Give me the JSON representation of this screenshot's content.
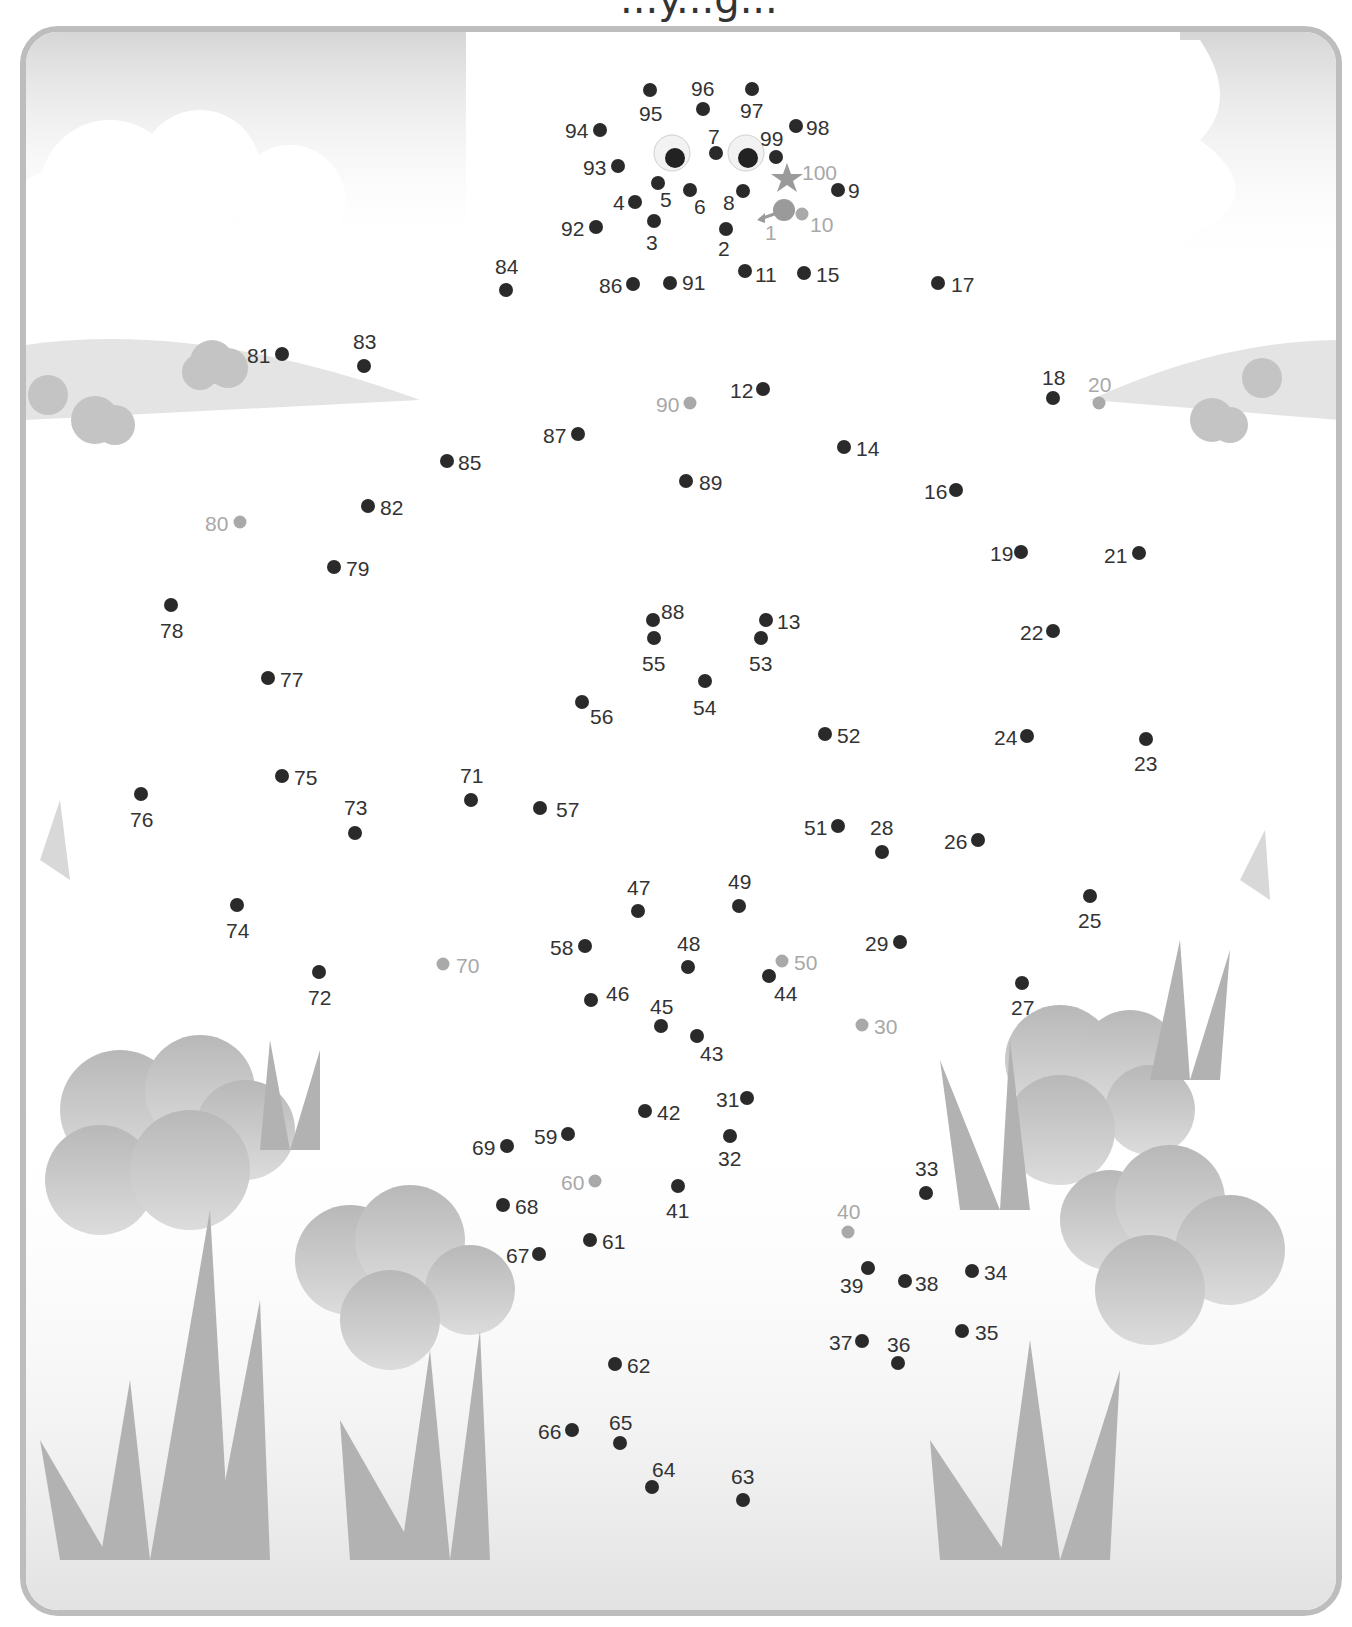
{
  "page": {
    "type": "dot-to-dot activity sheet",
    "title_fragment": "...y...g..."
  },
  "colors": {
    "dot_normal": "#2a2a2a",
    "dot_decade": "#a9a9a9",
    "frame": "#bdbdbd",
    "scenery": "#c8c8c8"
  },
  "start_marker": {
    "label": "1",
    "icon": "start-arrow-icon"
  },
  "end_marker": {
    "label": "100",
    "icon": "star-icon"
  },
  "decorations": [
    "googly-eye-left",
    "googly-eye-right",
    "cloud",
    "hills",
    "bushes",
    "grass-tufts"
  ],
  "dots": [
    {
      "n": "1",
      "x": 771,
      "y": 216,
      "lx": 765,
      "ly": 222,
      "grey": true,
      "start": true
    },
    {
      "n": "2",
      "x": 726,
      "y": 229,
      "lx": 718,
      "ly": 238,
      "grey": false
    },
    {
      "n": "3",
      "x": 654,
      "y": 221,
      "lx": 646,
      "ly": 232,
      "grey": false
    },
    {
      "n": "4",
      "x": 635,
      "y": 202,
      "lx": 613,
      "ly": 192,
      "grey": false
    },
    {
      "n": "5",
      "x": 658,
      "y": 183,
      "lx": 660,
      "ly": 189,
      "grey": false
    },
    {
      "n": "6",
      "x": 690,
      "y": 190,
      "lx": 694,
      "ly": 196,
      "grey": false
    },
    {
      "n": "7",
      "x": 716,
      "y": 153,
      "lx": 708,
      "ly": 126,
      "grey": false
    },
    {
      "n": "8",
      "x": 743,
      "y": 191,
      "lx": 723,
      "ly": 192,
      "grey": false
    },
    {
      "n": "9",
      "x": 838,
      "y": 190,
      "lx": 848,
      "ly": 180,
      "grey": false
    },
    {
      "n": "10",
      "x": 802,
      "y": 214,
      "lx": 810,
      "ly": 214,
      "grey": true
    },
    {
      "n": "11",
      "x": 745,
      "y": 271,
      "lx": 755,
      "ly": 264,
      "grey": false
    },
    {
      "n": "12",
      "x": 763,
      "y": 389,
      "lx": 730,
      "ly": 380,
      "grey": false
    },
    {
      "n": "13",
      "x": 766,
      "y": 620,
      "lx": 777,
      "ly": 611,
      "grey": false
    },
    {
      "n": "14",
      "x": 844,
      "y": 447,
      "lx": 856,
      "ly": 438,
      "grey": false
    },
    {
      "n": "15",
      "x": 804,
      "y": 273,
      "lx": 816,
      "ly": 264,
      "grey": false
    },
    {
      "n": "16",
      "x": 956,
      "y": 490,
      "lx": 924,
      "ly": 481,
      "grey": false
    },
    {
      "n": "17",
      "x": 938,
      "y": 283,
      "lx": 951,
      "ly": 274,
      "grey": false
    },
    {
      "n": "18",
      "x": 1053,
      "y": 398,
      "lx": 1042,
      "ly": 367,
      "grey": false
    },
    {
      "n": "19",
      "x": 1021,
      "y": 552,
      "lx": 990,
      "ly": 543,
      "grey": false
    },
    {
      "n": "20",
      "x": 1099,
      "y": 403,
      "lx": 1088,
      "ly": 374,
      "grey": true
    },
    {
      "n": "21",
      "x": 1139,
      "y": 553,
      "lx": 1104,
      "ly": 545,
      "grey": false
    },
    {
      "n": "22",
      "x": 1053,
      "y": 631,
      "lx": 1020,
      "ly": 622,
      "grey": false
    },
    {
      "n": "23",
      "x": 1146,
      "y": 739,
      "lx": 1134,
      "ly": 753,
      "grey": false
    },
    {
      "n": "24",
      "x": 1027,
      "y": 736,
      "lx": 994,
      "ly": 727,
      "grey": false
    },
    {
      "n": "25",
      "x": 1090,
      "y": 896,
      "lx": 1078,
      "ly": 910,
      "grey": false
    },
    {
      "n": "26",
      "x": 978,
      "y": 840,
      "lx": 944,
      "ly": 831,
      "grey": false
    },
    {
      "n": "27",
      "x": 1022,
      "y": 983,
      "lx": 1011,
      "ly": 997,
      "grey": false
    },
    {
      "n": "28",
      "x": 882,
      "y": 852,
      "lx": 870,
      "ly": 817,
      "grey": false
    },
    {
      "n": "29",
      "x": 900,
      "y": 942,
      "lx": 865,
      "ly": 933,
      "grey": false
    },
    {
      "n": "30",
      "x": 862,
      "y": 1025,
      "lx": 874,
      "ly": 1016,
      "grey": true
    },
    {
      "n": "31",
      "x": 747,
      "y": 1098,
      "lx": 716,
      "ly": 1089,
      "grey": false
    },
    {
      "n": "32",
      "x": 730,
      "y": 1136,
      "lx": 718,
      "ly": 1148,
      "grey": false
    },
    {
      "n": "33",
      "x": 926,
      "y": 1193,
      "lx": 915,
      "ly": 1158,
      "grey": false
    },
    {
      "n": "34",
      "x": 972,
      "y": 1271,
      "lx": 984,
      "ly": 1262,
      "grey": false
    },
    {
      "n": "35",
      "x": 962,
      "y": 1331,
      "lx": 975,
      "ly": 1322,
      "grey": false
    },
    {
      "n": "36",
      "x": 898,
      "y": 1363,
      "lx": 887,
      "ly": 1334,
      "grey": false
    },
    {
      "n": "37",
      "x": 862,
      "y": 1341,
      "lx": 829,
      "ly": 1332,
      "grey": false
    },
    {
      "n": "38",
      "x": 905,
      "y": 1281,
      "lx": 915,
      "ly": 1273,
      "grey": false
    },
    {
      "n": "39",
      "x": 868,
      "y": 1268,
      "lx": 840,
      "ly": 1275,
      "grey": false
    },
    {
      "n": "40",
      "x": 848,
      "y": 1232,
      "lx": 837,
      "ly": 1201,
      "grey": true
    },
    {
      "n": "41",
      "x": 678,
      "y": 1186,
      "lx": 666,
      "ly": 1200,
      "grey": false
    },
    {
      "n": "42",
      "x": 645,
      "y": 1111,
      "lx": 657,
      "ly": 1102,
      "grey": false
    },
    {
      "n": "43",
      "x": 697,
      "y": 1036,
      "lx": 700,
      "ly": 1043,
      "grey": false
    },
    {
      "n": "44",
      "x": 769,
      "y": 976,
      "lx": 774,
      "ly": 983,
      "grey": false
    },
    {
      "n": "45",
      "x": 661,
      "y": 1026,
      "lx": 650,
      "ly": 996,
      "grey": false
    },
    {
      "n": "46",
      "x": 591,
      "y": 1000,
      "lx": 606,
      "ly": 983,
      "grey": false
    },
    {
      "n": "47",
      "x": 638,
      "y": 911,
      "lx": 627,
      "ly": 877,
      "grey": false
    },
    {
      "n": "48",
      "x": 688,
      "y": 967,
      "lx": 677,
      "ly": 933,
      "grey": false
    },
    {
      "n": "49",
      "x": 739,
      "y": 906,
      "lx": 728,
      "ly": 871,
      "grey": false
    },
    {
      "n": "50",
      "x": 782,
      "y": 961,
      "lx": 794,
      "ly": 952,
      "grey": true
    },
    {
      "n": "51",
      "x": 838,
      "y": 826,
      "lx": 804,
      "ly": 817,
      "grey": false
    },
    {
      "n": "52",
      "x": 825,
      "y": 734,
      "lx": 837,
      "ly": 725,
      "grey": false
    },
    {
      "n": "53",
      "x": 761,
      "y": 638,
      "lx": 749,
      "ly": 653,
      "grey": false
    },
    {
      "n": "54",
      "x": 705,
      "y": 681,
      "lx": 693,
      "ly": 697,
      "grey": false
    },
    {
      "n": "55",
      "x": 654,
      "y": 638,
      "lx": 642,
      "ly": 653,
      "grey": false
    },
    {
      "n": "56",
      "x": 582,
      "y": 702,
      "lx": 590,
      "ly": 706,
      "grey": false
    },
    {
      "n": "57",
      "x": 540,
      "y": 808,
      "lx": 556,
      "ly": 799,
      "grey": false
    },
    {
      "n": "58",
      "x": 585,
      "y": 946,
      "lx": 550,
      "ly": 937,
      "grey": false
    },
    {
      "n": "59",
      "x": 568,
      "y": 1134,
      "lx": 534,
      "ly": 1126,
      "grey": false
    },
    {
      "n": "60",
      "x": 595,
      "y": 1181,
      "lx": 561,
      "ly": 1172,
      "grey": true
    },
    {
      "n": "61",
      "x": 590,
      "y": 1240,
      "lx": 602,
      "ly": 1231,
      "grey": false
    },
    {
      "n": "62",
      "x": 615,
      "y": 1364,
      "lx": 627,
      "ly": 1355,
      "grey": false
    },
    {
      "n": "63",
      "x": 743,
      "y": 1500,
      "lx": 731,
      "ly": 1466,
      "grey": false
    },
    {
      "n": "64",
      "x": 652,
      "y": 1487,
      "lx": 652,
      "ly": 1459,
      "grey": false
    },
    {
      "n": "65",
      "x": 620,
      "y": 1443,
      "lx": 609,
      "ly": 1412,
      "grey": false
    },
    {
      "n": "66",
      "x": 572,
      "y": 1430,
      "lx": 538,
      "ly": 1421,
      "grey": false
    },
    {
      "n": "67",
      "x": 539,
      "y": 1254,
      "lx": 506,
      "ly": 1245,
      "grey": false
    },
    {
      "n": "68",
      "x": 503,
      "y": 1205,
      "lx": 515,
      "ly": 1196,
      "grey": false
    },
    {
      "n": "69",
      "x": 507,
      "y": 1146,
      "lx": 472,
      "ly": 1137,
      "grey": false
    },
    {
      "n": "70",
      "x": 443,
      "y": 964,
      "lx": 456,
      "ly": 955,
      "grey": true
    },
    {
      "n": "71",
      "x": 471,
      "y": 800,
      "lx": 460,
      "ly": 765,
      "grey": false
    },
    {
      "n": "72",
      "x": 319,
      "y": 972,
      "lx": 308,
      "ly": 987,
      "grey": false
    },
    {
      "n": "73",
      "x": 355,
      "y": 833,
      "lx": 344,
      "ly": 797,
      "grey": false
    },
    {
      "n": "74",
      "x": 237,
      "y": 905,
      "lx": 226,
      "ly": 920,
      "grey": false
    },
    {
      "n": "75",
      "x": 282,
      "y": 776,
      "lx": 294,
      "ly": 767,
      "grey": false
    },
    {
      "n": "76",
      "x": 141,
      "y": 794,
      "lx": 130,
      "ly": 809,
      "grey": false
    },
    {
      "n": "77",
      "x": 268,
      "y": 678,
      "lx": 280,
      "ly": 669,
      "grey": false
    },
    {
      "n": "78",
      "x": 171,
      "y": 605,
      "lx": 160,
      "ly": 620,
      "grey": false
    },
    {
      "n": "79",
      "x": 334,
      "y": 567,
      "lx": 346,
      "ly": 558,
      "grey": false
    },
    {
      "n": "80",
      "x": 240,
      "y": 522,
      "lx": 205,
      "ly": 513,
      "grey": true
    },
    {
      "n": "81",
      "x": 282,
      "y": 354,
      "lx": 247,
      "ly": 345,
      "grey": false
    },
    {
      "n": "82",
      "x": 368,
      "y": 506,
      "lx": 380,
      "ly": 497,
      "grey": false
    },
    {
      "n": "83",
      "x": 364,
      "y": 366,
      "lx": 353,
      "ly": 331,
      "grey": false
    },
    {
      "n": "84",
      "x": 506,
      "y": 290,
      "lx": 495,
      "ly": 256,
      "grey": false
    },
    {
      "n": "85",
      "x": 447,
      "y": 461,
      "lx": 458,
      "ly": 452,
      "grey": false
    },
    {
      "n": "86",
      "x": 633,
      "y": 284,
      "lx": 599,
      "ly": 275,
      "grey": false
    },
    {
      "n": "87",
      "x": 578,
      "y": 434,
      "lx": 543,
      "ly": 425,
      "grey": false
    },
    {
      "n": "88",
      "x": 653,
      "y": 620,
      "lx": 661,
      "ly": 601,
      "grey": false
    },
    {
      "n": "89",
      "x": 686,
      "y": 481,
      "lx": 699,
      "ly": 472,
      "grey": false
    },
    {
      "n": "90",
      "x": 690,
      "y": 403,
      "lx": 656,
      "ly": 394,
      "grey": true
    },
    {
      "n": "91",
      "x": 670,
      "y": 283,
      "lx": 682,
      "ly": 272,
      "grey": false
    },
    {
      "n": "92",
      "x": 596,
      "y": 227,
      "lx": 561,
      "ly": 218,
      "grey": false
    },
    {
      "n": "93",
      "x": 618,
      "y": 166,
      "lx": 583,
      "ly": 157,
      "grey": false
    },
    {
      "n": "94",
      "x": 600,
      "y": 130,
      "lx": 565,
      "ly": 120,
      "grey": false
    },
    {
      "n": "95",
      "x": 650,
      "y": 90,
      "lx": 639,
      "ly": 103,
      "grey": false
    },
    {
      "n": "96",
      "x": 703,
      "y": 109,
      "lx": 691,
      "ly": 78,
      "grey": false
    },
    {
      "n": "97",
      "x": 752,
      "y": 89,
      "lx": 740,
      "ly": 100,
      "grey": false
    },
    {
      "n": "98",
      "x": 796,
      "y": 126,
      "lx": 806,
      "ly": 117,
      "grey": false
    },
    {
      "n": "99",
      "x": 776,
      "y": 157,
      "lx": 760,
      "ly": 128,
      "grey": false
    },
    {
      "n": "100",
      "x": 787,
      "y": 177,
      "lx": 802,
      "ly": 162,
      "grey": true,
      "end": true
    }
  ]
}
